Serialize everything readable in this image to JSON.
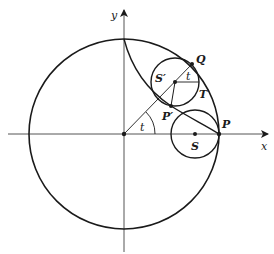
{
  "diagram": {
    "type": "hypocycloid-construction",
    "axes": {
      "x_label": "x",
      "y_label": "y"
    },
    "points": {
      "origin": "O",
      "P": "P",
      "P_prime": "P′",
      "Q": "Q",
      "S": "S",
      "S_prime": "S′",
      "T": "T"
    },
    "angle_labels": {
      "at_origin": "t",
      "at_S_prime": "t"
    },
    "elements": [
      "large circle centered at origin",
      "small circle centered at S tangent at P",
      "small circle centered at S' tangent at Q",
      "hypocycloid arc from top of large circle to P through P'",
      "ray from origin through S' to Q",
      "segment S'P'",
      "horizontal segment S'T"
    ],
    "colors": {
      "stroke": "#1a1a1a",
      "background": "#ffffff"
    }
  }
}
